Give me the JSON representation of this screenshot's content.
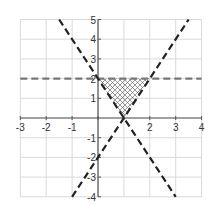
{
  "chart_data": {
    "type": "line",
    "title": "",
    "xlabel": "",
    "ylabel": "",
    "xlim": [
      -3,
      4
    ],
    "ylim": [
      -4,
      5
    ],
    "grid": true,
    "x_ticks": [
      -3,
      -2,
      -1,
      0,
      1,
      2,
      3,
      4
    ],
    "y_ticks": [
      -4,
      -3,
      -2,
      -1,
      1,
      2,
      3,
      4,
      5
    ],
    "x_tick_labels": [
      "-3",
      "-2",
      "-1",
      "2",
      "3",
      "4"
    ],
    "y_tick_labels": [
      "5",
      "4",
      "3",
      "2",
      "1",
      "-1",
      "-2",
      "-3",
      "-4"
    ],
    "series": [
      {
        "name": "y = 2",
        "style": "dashed",
        "color": "#777777",
        "points": [
          [
            -3,
            2
          ],
          [
            4,
            2
          ]
        ]
      },
      {
        "name": "y = -2x + 2",
        "style": "dashed",
        "color": "#222222",
        "points": [
          [
            -1.5,
            5
          ],
          [
            3,
            -4
          ]
        ]
      },
      {
        "name": "y = 2x - 2",
        "style": "dashed",
        "color": "#222222",
        "points": [
          [
            -1,
            -4
          ],
          [
            3.5,
            5
          ]
        ]
      }
    ],
    "shaded_region": {
      "pattern": "crosshatch",
      "vertices": [
        [
          0,
          2
        ],
        [
          2,
          2
        ],
        [
          1,
          0
        ]
      ]
    },
    "legend": null
  },
  "colors": {
    "grid": "#d9d9d9",
    "axis": "#555555",
    "hatch": "#555555"
  }
}
